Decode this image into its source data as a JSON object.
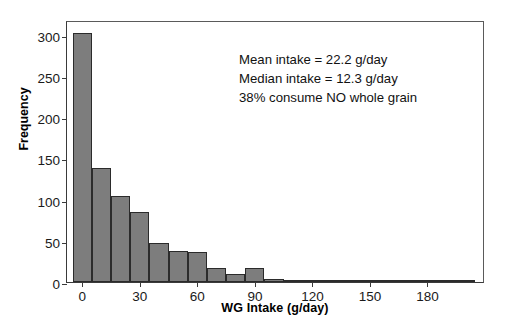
{
  "chart_data": {
    "type": "bar",
    "title": "",
    "xlabel": "WG Intake (g/day)",
    "ylabel": "Frequency",
    "xlim": [
      -8,
      210
    ],
    "ylim": [
      0,
      318
    ],
    "grid": false,
    "legend": "none",
    "bin_width": 10,
    "xticks": [
      0,
      30,
      60,
      90,
      120,
      150,
      180
    ],
    "yticks": [
      0,
      50,
      100,
      150,
      200,
      250,
      300
    ],
    "bin_starts": [
      -5,
      5,
      15,
      25,
      35,
      45,
      55,
      65,
      75,
      85,
      95,
      105,
      115,
      125,
      135,
      145,
      155,
      165,
      175,
      185,
      195
    ],
    "categories": [
      "0",
      "10",
      "20",
      "30",
      "40",
      "50",
      "60",
      "70",
      "80",
      "90",
      "100",
      "110",
      "120",
      "130",
      "140",
      "150",
      "160",
      "170",
      "180",
      "190",
      "200"
    ],
    "values": [
      302,
      138,
      105,
      85,
      47,
      38,
      37,
      17,
      10,
      17,
      4,
      3,
      3,
      3,
      3,
      1,
      0,
      1,
      1,
      1,
      1
    ],
    "annotations": [
      "Mean intake = 22.2 g/day",
      "Median intake = 12.3 g/day",
      "38% consume NO whole grain"
    ],
    "bar_fill_color": "#7d7d7d",
    "bar_edge_color": "#2b2b2b",
    "axis_color": "#3a3a3a",
    "background_color": "#ffffff"
  }
}
